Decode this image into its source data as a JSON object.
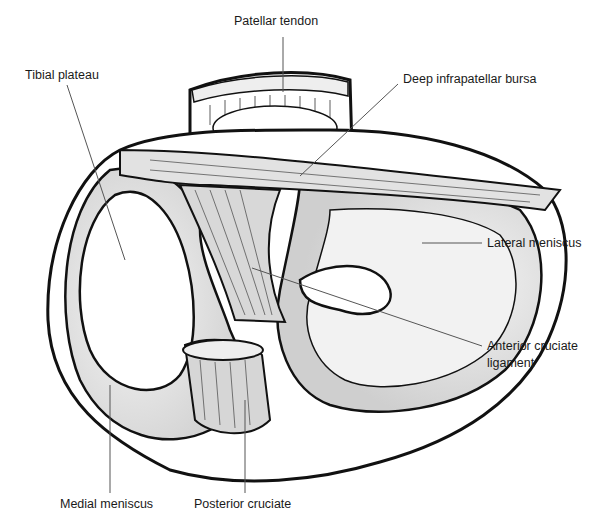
{
  "figure": {
    "labels": [
      {
        "id": "patellar-tendon",
        "text": "Patellar tendon"
      },
      {
        "id": "tibial-plateau",
        "text": "Tibial plateau"
      },
      {
        "id": "deep-infrapatellar-bursa",
        "text": "Deep infrapatellar bursa"
      },
      {
        "id": "lateral-meniscus",
        "text": "Lateral meniscus"
      },
      {
        "id": "anterior-cruciate-ligament",
        "text": "Anterior cruciate\nligament",
        "line1": "Anterior cruciate",
        "line2": "ligament"
      },
      {
        "id": "medial-meniscus",
        "text": "Medial meniscus"
      },
      {
        "id": "posterior-cruciate",
        "text": "Posterior cruciate"
      }
    ],
    "colors": {
      "stroke": "#111111",
      "shade": "#d4d4d4",
      "leader": "#555555"
    }
  }
}
